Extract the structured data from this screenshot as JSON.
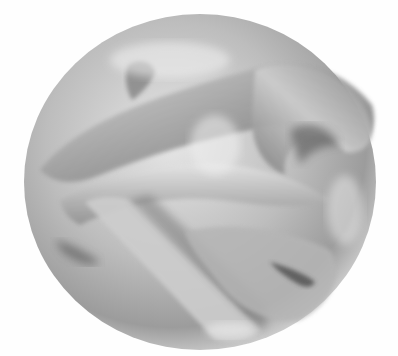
{
  "image": {
    "subject": "3D rendered grayscale manifold surface (Calabi-Yau style) inside a sphere-like form",
    "background": "#fefefe",
    "palette": {
      "highlight": "#e8e8e8",
      "midtone": "#a9a9a9",
      "shadow": "#5a5a5a",
      "deep_shadow": "#3c3c3c"
    }
  }
}
